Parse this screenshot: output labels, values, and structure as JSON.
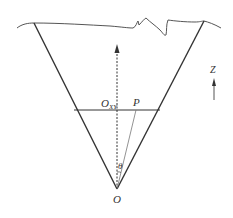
{
  "diagram": {
    "labels": {
      "apex": "O",
      "center": "O",
      "center_sub": "XY",
      "point": "P",
      "angle": "θ",
      "axis": "Z"
    },
    "colors": {
      "line": "#333333",
      "thin_line": "#777777",
      "surface": "#555555"
    }
  }
}
